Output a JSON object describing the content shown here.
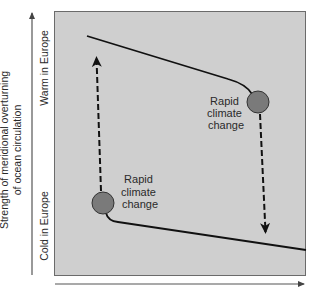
{
  "diagram": {
    "y_axis_label_line1": "Strength of meridional overturning",
    "y_axis_label_line2": "of ocean circulation",
    "y_tick_top": "Warm in Europe",
    "y_tick_bottom": "Cold in Europe",
    "upper_transition_label": [
      "Rapid",
      "climate",
      "change"
    ],
    "lower_transition_label": [
      "Rapid",
      "climate",
      "change"
    ],
    "colors": {
      "plot_background": "#cfcfcf",
      "circle_fill": "#7a7a7a",
      "line": "#111111",
      "axis": "#555555"
    }
  }
}
